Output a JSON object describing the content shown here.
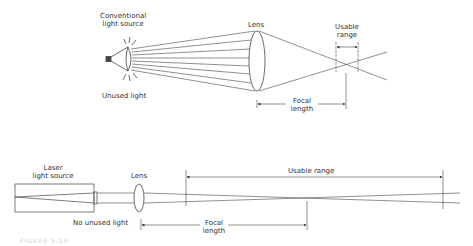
{
  "top_diagram": {
    "light_source_label_line1": "Conventional",
    "light_source_label_line2": "light source",
    "unused_light_label": "Unused light",
    "lens_label": "Lens",
    "usable_range_line1": "Usable",
    "usable_range_line2": "range",
    "focal_length_line1": "Focal",
    "focal_length_line2": "length"
  },
  "bottom_diagram": {
    "light_source_label_line1": "Laser",
    "light_source_label_line2": "light source",
    "no_unused_light_label": "No unused light",
    "lens_label": "Lens",
    "usable_range_label": "Usable range",
    "focal_length_line1": "Focal",
    "focal_length_line2": "length"
  },
  "caption": {
    "text": "FIGURE 5-10"
  },
  "colors": {
    "line": "#444444",
    "text": "#333333",
    "background": "#ffffff"
  }
}
